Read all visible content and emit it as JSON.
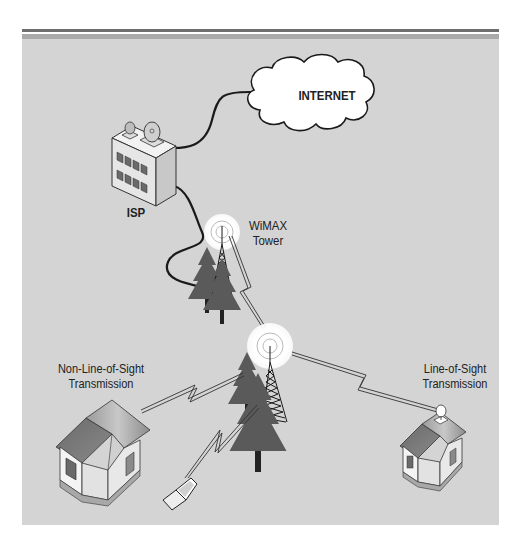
{
  "figure": {
    "colors": {
      "panel_background": "#d4d4d4",
      "top_rule_dark": "#6e6e6e",
      "top_rule_light": "#a9a9a9",
      "tree_fill": "#5a5a5a",
      "cloud_fill": "#ffffff",
      "wire": "#1a1a1a"
    }
  },
  "nodes": {
    "internet": {
      "label": "INTERNET",
      "icon": "cloud-icon"
    },
    "isp": {
      "label": "ISP",
      "icon": "office-building-with-satellite-dishes-icon"
    },
    "wimax_tower": {
      "label_line1": "WiMAX",
      "label_line2": "Tower",
      "icon": "radio-tower-icon"
    },
    "relay_tower": {
      "icon": "radio-tower-icon"
    },
    "nlos_house": {
      "label_line1": "Non-Line-of-Sight",
      "label_line2": "Transmission",
      "icon": "house-icon"
    },
    "los_house": {
      "label_line1": "Line-of-Sight",
      "label_line2": "Transmission",
      "icon": "house-with-dish-icon"
    },
    "laptop": {
      "icon": "laptop-icon"
    }
  },
  "connections": [
    {
      "from": "isp",
      "to": "internet",
      "type": "wired"
    },
    {
      "from": "isp",
      "to": "wimax_tower",
      "type": "wired"
    },
    {
      "from": "wimax_tower",
      "to": "relay_tower",
      "type": "wireless"
    },
    {
      "from": "relay_tower",
      "to": "nlos_house",
      "type": "wireless"
    },
    {
      "from": "relay_tower",
      "to": "laptop",
      "type": "wireless"
    },
    {
      "from": "relay_tower",
      "to": "los_house",
      "type": "wireless-line-of-sight"
    }
  ]
}
